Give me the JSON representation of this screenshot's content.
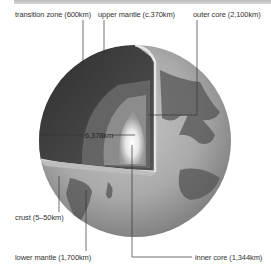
{
  "labels": {
    "transition_zone": "transition zone (600km)",
    "upper_mantle": "upper mantle (c.370km)",
    "outer_core": "outer core (2,100km)",
    "radius": "6,378km",
    "crust": "crust (5–50km)",
    "lower_mantle": "lower mantle (1,700km)",
    "inner_core": "inner core (1,344km)"
  },
  "colors": {
    "background": "#ffffff",
    "leader_line": "#333333",
    "text": "#333333"
  }
}
